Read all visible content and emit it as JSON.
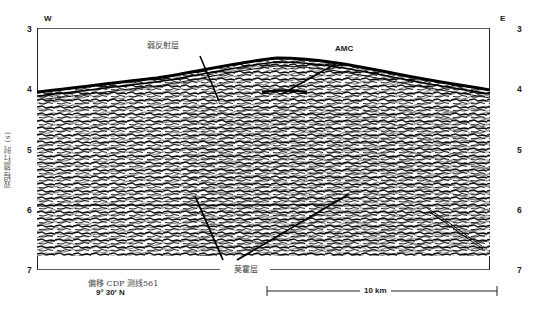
{
  "figure": {
    "type": "seismic_reflection_profile",
    "direction_left": "W",
    "direction_right": "E",
    "y_axis": {
      "label": "双程旅行时 (s)",
      "ticks": [
        "3",
        "4",
        "5",
        "6",
        "7"
      ],
      "range": [
        3,
        7
      ]
    },
    "annotations": [
      {
        "label": "弱反射层",
        "target": "weak-reflection-layer"
      },
      {
        "label": "AMC",
        "target": "axial-magma-chamber"
      },
      {
        "label": "莫霍层",
        "target": "moho-layer"
      }
    ],
    "caption_line1": "偏移  CDP 测线561",
    "caption_line2": "9° 30′ N",
    "scale_bar": {
      "label": "10 km",
      "length_km": 10
    }
  },
  "colors": {
    "ink": "#1a1a1a",
    "background": "#ffffff",
    "label_gray": "#444444"
  }
}
